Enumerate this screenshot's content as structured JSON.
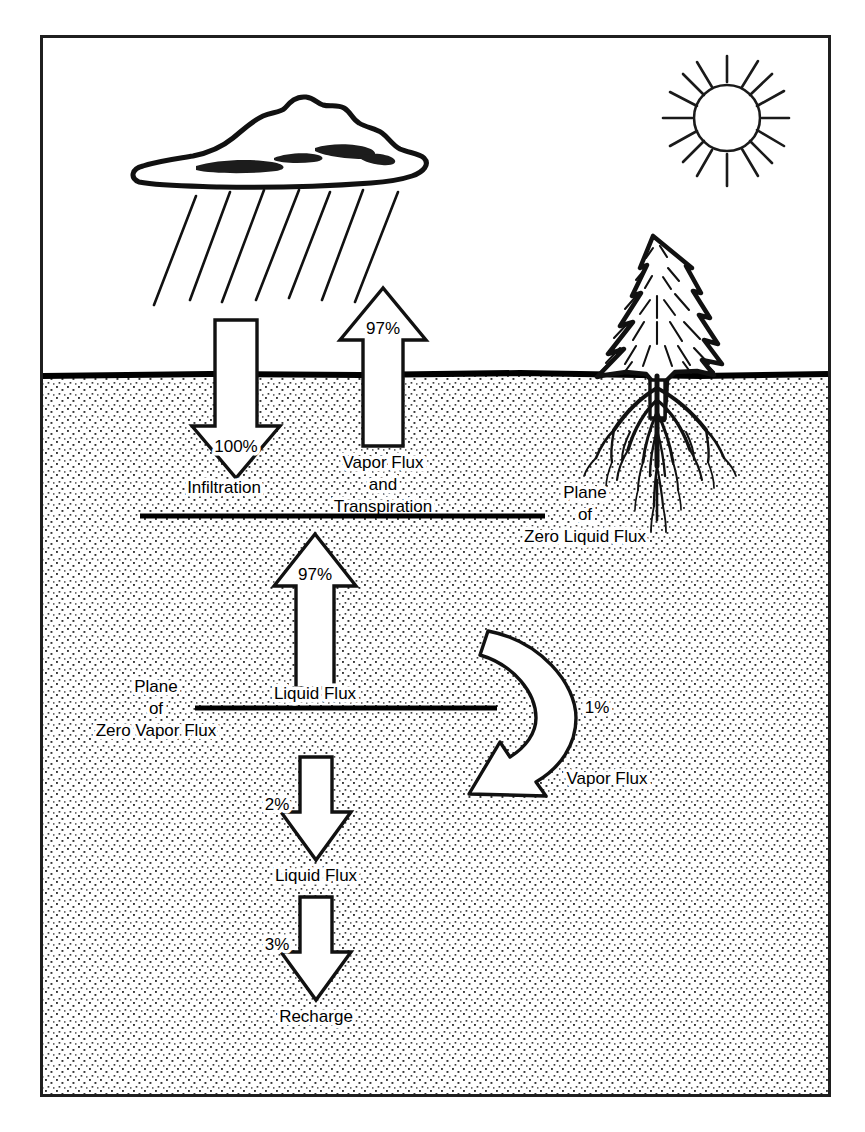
{
  "figure": {
    "frame": {
      "border_color": "#1a1a1a"
    },
    "colors": {
      "ink": "#000000",
      "soil_fill": "#ffffff",
      "soil_stipple": "#3a3a3a",
      "sky": "#ffffff",
      "arrow_fill": "#ffffff",
      "arrow_stroke": "#000000",
      "ground_line": "#000000"
    }
  },
  "scene": {
    "sky_label": "sky",
    "soil_label": "soil",
    "ground_surface_label": "ground-surface"
  },
  "icons": {
    "cloud": "rain-cloud-icon",
    "sun": "sun-icon",
    "tree": "conifer-tree-icon",
    "roots": "tree-roots-icon",
    "rain": "rain-streaks-icon"
  },
  "arrows": [
    {
      "id": "infiltration",
      "name": "infiltration-arrow",
      "direction": "down",
      "percent": "100%",
      "label": "Infiltration"
    },
    {
      "id": "vapor-flux-transpiration",
      "name": "vapor-flux-transpiration-arrow",
      "direction": "up",
      "percent": "97%",
      "label": "Vapor Flux\nand\nTranspiration",
      "label_lines": [
        "Vapor Flux",
        "and",
        "Transpiration"
      ]
    },
    {
      "id": "liquid-flux-up",
      "name": "liquid-flux-up-arrow",
      "direction": "up",
      "percent": "97%",
      "label": "Liquid Flux"
    },
    {
      "id": "vapor-flux-curved",
      "name": "vapor-flux-curved-arrow",
      "direction": "curved-down-left",
      "percent": "1%",
      "label": "Vapor Flux"
    },
    {
      "id": "liquid-flux-down",
      "name": "liquid-flux-down-arrow",
      "direction": "down",
      "percent": "2%",
      "label": "Liquid Flux"
    },
    {
      "id": "recharge",
      "name": "recharge-arrow",
      "direction": "down",
      "percent": "3%",
      "label": "Recharge"
    }
  ],
  "planes": [
    {
      "id": "zero-liquid-flux",
      "name": "plane-of-zero-liquid-flux",
      "lines": [
        "Plane",
        "of",
        "Zero Liquid Flux"
      ]
    },
    {
      "id": "zero-vapor-flux",
      "name": "plane-of-zero-vapor-flux",
      "lines": [
        "Plane",
        "of",
        "Zero Vapor Flux"
      ]
    }
  ],
  "labels": {
    "infiltration": "Infiltration",
    "vapor_flux_line1": "Vapor Flux",
    "vapor_flux_line2": "and",
    "vapor_flux_line3": "Transpiration",
    "liquid_flux_mid": "Liquid Flux",
    "liquid_flux_lower": "Liquid Flux",
    "vapor_flux_curved": "Vapor Flux",
    "recharge": "Recharge",
    "plane_a_1": "Plane",
    "plane_a_2": "of",
    "plane_a_3": "Zero Liquid Flux",
    "plane_b_1": "Plane",
    "plane_b_2": "of",
    "plane_b_3": "Zero Vapor Flux"
  },
  "percentages": {
    "infiltration": "100%",
    "vapor_transpiration": "97%",
    "liquid_flux_up": "97%",
    "vapor_flux_curved": "1%",
    "liquid_flux_down": "2%",
    "recharge": "3%"
  }
}
